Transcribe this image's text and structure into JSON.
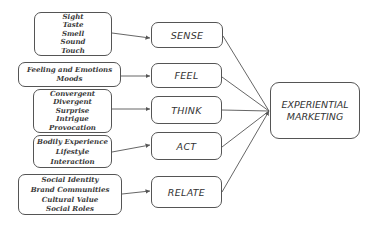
{
  "diagram": {
    "target": {
      "label_lines": [
        "EXPERIENTIAL",
        "MARKETING"
      ]
    },
    "modules": [
      {
        "label": "SENSE",
        "items": [
          "Sight",
          "Taste",
          "Smell",
          "Sound",
          "Touch"
        ]
      },
      {
        "label": "FEEL",
        "items": [
          "Feeling and Emotions",
          "Moods"
        ]
      },
      {
        "label": "THINK",
        "items": [
          "Convergent",
          "Divergent",
          "Surprise",
          "Intrigue",
          "Provocation"
        ]
      },
      {
        "label": "ACT",
        "items": [
          "Bodily Experience",
          "Lifestyle",
          "Interaction"
        ]
      },
      {
        "label": "RELATE",
        "items": [
          "Social Identity",
          "Brand Communities",
          "Cultural Value",
          "Social Roles"
        ]
      }
    ]
  },
  "colors": {
    "stroke": "#555555",
    "text": "#333333",
    "background": "#ffffff"
  }
}
